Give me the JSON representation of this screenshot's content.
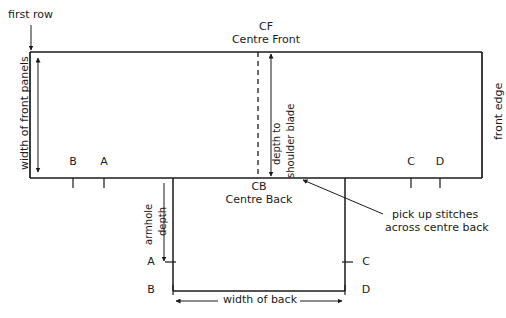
{
  "diagram": {
    "title_hidden": "",
    "annotations": {
      "first_row": "first row",
      "width_of_front_panels": "width of front panels",
      "front_edge": "front edge",
      "cf_abbr": "CF",
      "cf_full": "Centre Front",
      "cb_abbr": "CB",
      "cb_full": "Centre Back",
      "depth_to_shoulder_blade_line1": "depth to",
      "depth_to_shoulder_blade_line2": "shoulder blade",
      "armhole_line1": "armhole",
      "armhole_line2": "depth",
      "width_of_back": "width of back",
      "pick_up_line1": "pick up stitches",
      "pick_up_line2": "across centre back"
    },
    "markers": {
      "front_top_left": "B",
      "front_top_right": "A",
      "front_bottom_left": "C",
      "front_bottom_right": "D",
      "back_left_upper": "A",
      "back_left_lower": "B",
      "back_right_upper": "C",
      "back_right_lower": "D"
    },
    "colors": {
      "stroke": "#1a1a1a",
      "text": "#1a1a1a",
      "background": "#ffffff"
    }
  }
}
